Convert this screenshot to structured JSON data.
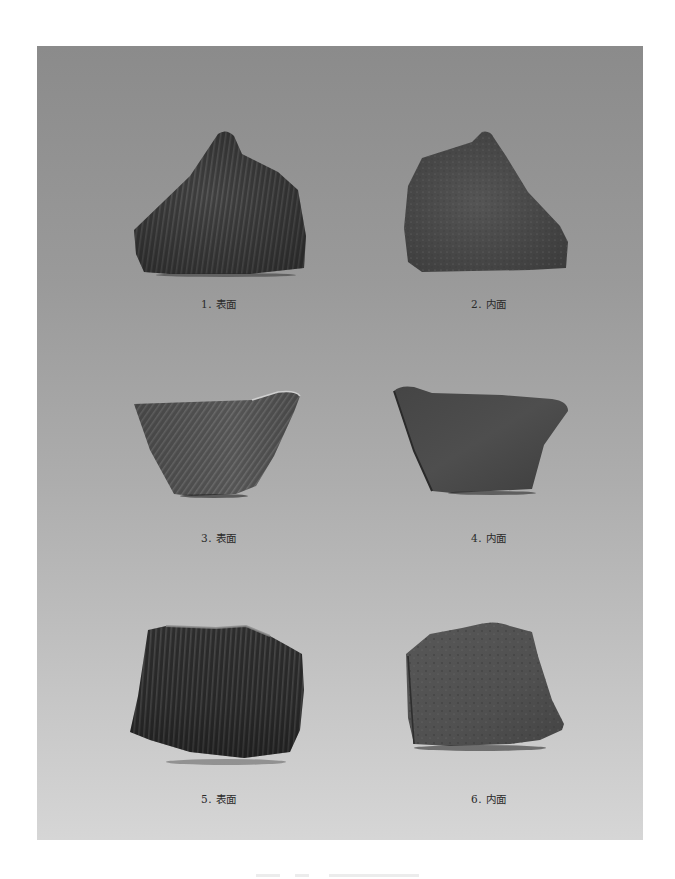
{
  "plate": {
    "background_top": "#8b8b8b",
    "background_bottom": "#d6d6d6"
  },
  "figures": [
    {
      "number": "1",
      "label": "1. 表面",
      "side": "exterior",
      "decoration": "vertical cord-mark grooves",
      "color": "#3e3e3e"
    },
    {
      "number": "2",
      "label": "2. 内面",
      "side": "interior",
      "decoration": "plain mottled surface",
      "color": "#4a4a4a"
    },
    {
      "number": "3",
      "label": "3. 表面",
      "side": "exterior",
      "decoration": "diagonal cord-mark grooves",
      "color": "#5a5a5a"
    },
    {
      "number": "4",
      "label": "4. 内面",
      "side": "interior",
      "decoration": "plain surface",
      "color": "#4c4c4c"
    },
    {
      "number": "5",
      "label": "5. 表面",
      "side": "exterior",
      "decoration": "dense vertical ribbing",
      "color": "#2e2e2e"
    },
    {
      "number": "6",
      "label": "6. 内面",
      "side": "interior",
      "decoration": "plain mottled surface",
      "color": "#555555"
    }
  ],
  "caption": {
    "text": ""
  }
}
